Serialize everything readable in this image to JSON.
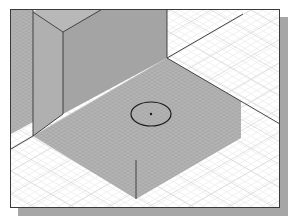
{
  "scene": {
    "description": "Isometric CAD view: tall rectangular block standing on a square base plate with a circle sketch and center point, on an isometric grid",
    "colors": {
      "background": "#ffffff",
      "grid_light": "#e4e4e4",
      "grid_on_shaded": "#b9b9b9",
      "shaded_face": "#a9a9a9",
      "block_front_face": "#a4a4a4",
      "block_side_face": "#b0b0b0",
      "block_top_face": "#b8b8b8",
      "edge": "#333333",
      "circle": "#1a1a1a",
      "frame_border": "#3a3a3a",
      "frame_shadow": "#a6a6a6"
    },
    "circle": {
      "cx": 140,
      "cy": 104,
      "rx": 20,
      "ry": 12,
      "center_point": true
    },
    "label": "Isometric 3D viewport"
  }
}
